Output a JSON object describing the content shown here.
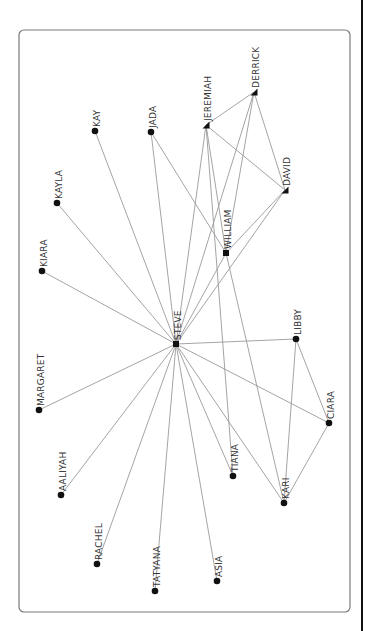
{
  "diagram": {
    "type": "network-graph",
    "orientation": "rotated-90-ccw",
    "frame": {
      "x": 19,
      "y": 30,
      "width": 331,
      "height": 582,
      "radius": 5
    },
    "colors": {
      "edge": "#9a9a9a",
      "node": "#111111",
      "label": "#333333",
      "frame": "#7a7a7a"
    },
    "nodes": [
      {
        "id": "STEVE",
        "label": "STEVE",
        "x": 176,
        "y": 344,
        "shape": "square"
      },
      {
        "id": "DERRICK",
        "label": "DERRICK",
        "x": 254,
        "y": 92,
        "shape": "triangle"
      },
      {
        "id": "JEREMIAH",
        "label": "JEREMIAH",
        "x": 206,
        "y": 125,
        "shape": "triangle"
      },
      {
        "id": "DAVID",
        "label": "DAVID",
        "x": 285,
        "y": 190,
        "shape": "triangle"
      },
      {
        "id": "WILLIAM",
        "label": "WILLIAM",
        "x": 226,
        "y": 253,
        "shape": "square"
      },
      {
        "id": "JADA",
        "label": "JADA",
        "x": 151,
        "y": 132,
        "shape": "circle"
      },
      {
        "id": "KAY",
        "label": "KAY",
        "x": 95,
        "y": 131,
        "shape": "circle"
      },
      {
        "id": "KAYLA",
        "label": "KAYLA",
        "x": 57,
        "y": 203,
        "shape": "circle"
      },
      {
        "id": "KIARA",
        "label": "KIARA",
        "x": 42,
        "y": 271,
        "shape": "circle"
      },
      {
        "id": "MARGARET",
        "label": "MARGARET",
        "x": 39,
        "y": 410,
        "shape": "circle"
      },
      {
        "id": "AALIYAH",
        "label": "AALIYAH",
        "x": 61,
        "y": 495,
        "shape": "circle"
      },
      {
        "id": "RACHEL",
        "label": "RACHEL",
        "x": 97,
        "y": 564,
        "shape": "circle"
      },
      {
        "id": "TATYANA",
        "label": "TATYANA",
        "x": 155,
        "y": 591,
        "shape": "circle"
      },
      {
        "id": "ASIA",
        "label": "ASIA",
        "x": 217,
        "y": 581,
        "shape": "circle"
      },
      {
        "id": "TIANA",
        "label": "TIANA",
        "x": 233,
        "y": 476,
        "shape": "circle"
      },
      {
        "id": "KARI",
        "label": "KARI",
        "x": 284,
        "y": 503,
        "shape": "circle"
      },
      {
        "id": "CIARA",
        "label": "CIARA",
        "x": 329,
        "y": 423,
        "shape": "circle"
      },
      {
        "id": "LIBBY",
        "label": "LIBBY",
        "x": 296,
        "y": 339,
        "shape": "circle"
      }
    ],
    "edges": [
      [
        "STEVE",
        "KAYLA"
      ],
      [
        "STEVE",
        "KAY"
      ],
      [
        "STEVE",
        "JADA"
      ],
      [
        "STEVE",
        "JEREMIAH"
      ],
      [
        "STEVE",
        "DERRICK"
      ],
      [
        "STEVE",
        "WILLIAM"
      ],
      [
        "STEVE",
        "DAVID"
      ],
      [
        "STEVE",
        "KIARA"
      ],
      [
        "STEVE",
        "MARGARET"
      ],
      [
        "STEVE",
        "AALIYAH"
      ],
      [
        "STEVE",
        "RACHEL"
      ],
      [
        "STEVE",
        "TATYANA"
      ],
      [
        "STEVE",
        "ASIA"
      ],
      [
        "STEVE",
        "TIANA"
      ],
      [
        "STEVE",
        "KARI"
      ],
      [
        "STEVE",
        "CIARA"
      ],
      [
        "STEVE",
        "LIBBY"
      ],
      [
        "DERRICK",
        "JEREMIAH"
      ],
      [
        "DERRICK",
        "DAVID"
      ],
      [
        "DERRICK",
        "WILLIAM"
      ],
      [
        "JEREMIAH",
        "DAVID"
      ],
      [
        "JEREMIAH",
        "WILLIAM"
      ],
      [
        "JEREMIAH",
        "TIANA"
      ],
      [
        "JADA",
        "WILLIAM"
      ],
      [
        "WILLIAM",
        "DAVID"
      ],
      [
        "WILLIAM",
        "KARI"
      ],
      [
        "LIBBY",
        "KARI"
      ],
      [
        "LIBBY",
        "CIARA"
      ],
      [
        "KARI",
        "CIARA"
      ]
    ]
  }
}
